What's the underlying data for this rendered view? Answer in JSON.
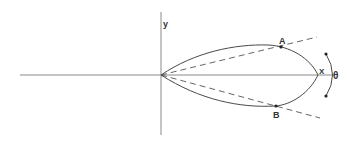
{
  "diagram": {
    "labels": {
      "y_axis": "y",
      "point_a": "A",
      "point_b": "B",
      "point_x": "X",
      "angle": "θ"
    },
    "colors": {
      "stroke": "#4a4a4a",
      "axis": "#888888",
      "background": "#ffffff"
    }
  }
}
